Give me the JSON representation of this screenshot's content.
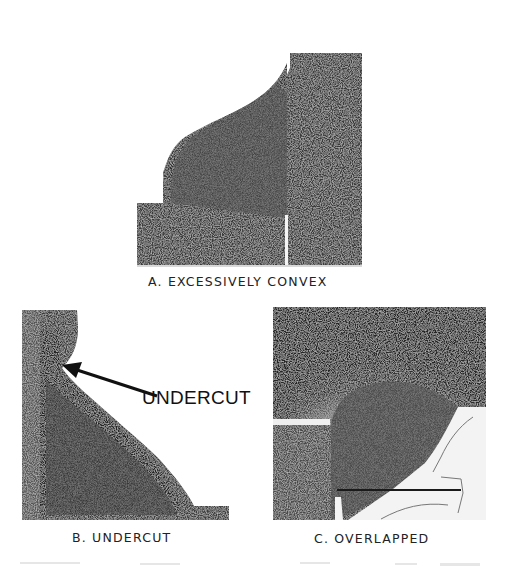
{
  "figure": {
    "panels": [
      {
        "id": "A",
        "caption": "A. EXCESSIVELY CONVEX",
        "description": "weld cross-section with excessively convex profile"
      },
      {
        "id": "B",
        "caption": "B. UNDERCUT",
        "description": "weld cross-section showing undercut at toe",
        "callout": "UNDERCUT"
      },
      {
        "id": "C",
        "caption": "C. OVERLAPPED",
        "description": "weld cross-section with overlapped weld metal"
      }
    ]
  },
  "colors": {
    "paper": "#ffffff",
    "metal_dark": "#2a2a2a",
    "metal_mid": "#4a4a4a",
    "weld_light": "#8a8a8a",
    "ink": "#1e1e1e"
  }
}
